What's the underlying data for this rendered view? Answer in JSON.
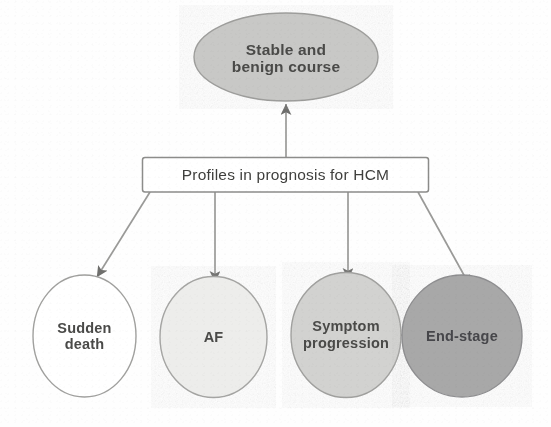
{
  "diagram": {
    "title": "Profiles in prognosis for HCM",
    "type": "flowchart",
    "nodes": {
      "central_box": {
        "id": "profiles",
        "label": "Profiles in prognosis for HCM",
        "shape": "rectangle",
        "fill": "#ffffff",
        "stroke": "#8c8c8a"
      },
      "outcome_top": {
        "id": "stable-benign",
        "label_line1": "Stable and",
        "label_line2": "benign course",
        "label": "Stable and benign course",
        "shape": "ellipse",
        "fill": "#c8c8c6",
        "stroke": "#9d9d9b"
      },
      "outcomes_bottom": [
        {
          "id": "sudden-death",
          "label_line1": "Sudden",
          "label_line2": "death",
          "label": "Sudden death",
          "shape": "ellipse",
          "fill": "#ffffff",
          "stroke": "#a0a09e"
        },
        {
          "id": "af",
          "label_line1": "AF",
          "label_line2": "",
          "label": "AF",
          "shape": "ellipse",
          "fill": "#ededeb",
          "stroke": "#a5a5a3"
        },
        {
          "id": "symptom-progression",
          "label_line1": "Symptom",
          "label_line2": "progression",
          "label": "Symptom progression",
          "shape": "ellipse",
          "fill": "#d2d2d0",
          "stroke": "#a0a09e"
        },
        {
          "id": "end-stage",
          "label_line1": "End-stage",
          "label_line2": "",
          "label": "End-stage",
          "shape": "ellipse",
          "fill": "#a8a8a8",
          "stroke": "#8e8e90"
        }
      ]
    },
    "edges": [
      {
        "id": "edge-profiles-to-stable",
        "from": "profiles",
        "to": "stable-benign",
        "direction": "up",
        "arrowhead": "filled"
      },
      {
        "id": "edge-profiles-to-sudden",
        "from": "profiles",
        "to": "sudden-death",
        "direction": "down-left",
        "arrowhead": "filled"
      },
      {
        "id": "edge-profiles-to-af",
        "from": "profiles",
        "to": "af",
        "direction": "down",
        "arrowhead": "filled"
      },
      {
        "id": "edge-profiles-to-symptom",
        "from": "profiles",
        "to": "symptom-progression",
        "direction": "down",
        "arrowhead": "filled"
      },
      {
        "id": "edge-profiles-to-endstage",
        "from": "profiles",
        "to": "end-stage",
        "direction": "down-right",
        "arrowhead": "filled"
      },
      {
        "id": "edge-symptom-to-endstage",
        "from": "symptom-progression",
        "to": "end-stage",
        "direction": "right",
        "arrowhead": "filled"
      }
    ],
    "colors": {
      "line": "#9a9a98",
      "text": "#4a4a48",
      "background": "#fefefe"
    }
  },
  "caption": {
    "text": ""
  }
}
